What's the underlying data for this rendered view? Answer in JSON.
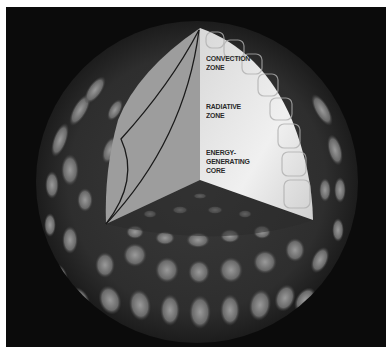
{
  "figure": {
    "colors": {
      "background": "#0b0b0b",
      "sphere_dark": "#2c2c2c",
      "granule_light": "#8a8a8a",
      "left_face": "#9d9d9d",
      "right_face": "#e6e6e6",
      "outline": "#1a1a1a",
      "label_text": "#2a2a2a"
    }
  },
  "labels": [
    {
      "id": "convection",
      "lines": [
        "CONVECTION",
        "ZONE"
      ]
    },
    {
      "id": "radiative",
      "lines": [
        "RADIATIVE",
        "ZONE"
      ]
    },
    {
      "id": "core",
      "lines": [
        "ENERGY-",
        "GENERATING",
        "CORE"
      ]
    }
  ]
}
